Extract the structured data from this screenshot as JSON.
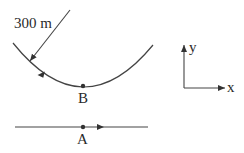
{
  "diagram": {
    "radius_label": "300 m",
    "point_b_label": "B",
    "point_a_label": "A",
    "axis_y_label": "y",
    "axis_x_label": "x",
    "stroke_color": "#333333"
  }
}
